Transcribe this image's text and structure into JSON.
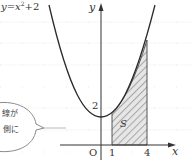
{
  "diagram": {
    "equation_label": "y = x² + 2",
    "equation_parts": {
      "y": "y",
      "eq": "=",
      "x": "x",
      "sup": "2",
      "plus": "+2"
    },
    "axes": {
      "x_label": "x",
      "y_label": "y",
      "origin_label": "O"
    },
    "ticks": {
      "x": [
        "1",
        "4"
      ],
      "y": [
        "2"
      ]
    },
    "region_label": "S",
    "callout": {
      "line1": "線が",
      "line2": "側に"
    },
    "colors": {
      "curve": "#2a2a2a",
      "axis": "#333333",
      "hatch": "#555555",
      "grid": "#cfcfcf",
      "bubble": "#8a8a8a"
    }
  }
}
